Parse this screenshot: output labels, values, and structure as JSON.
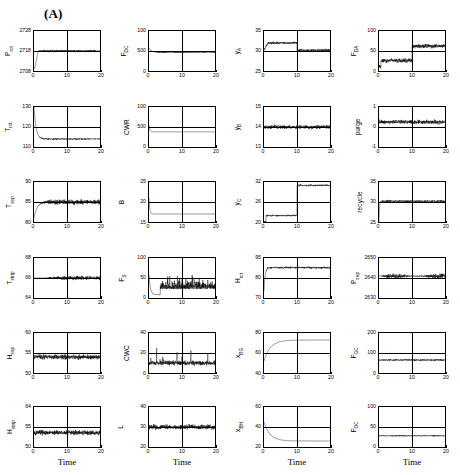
{
  "figure": {
    "panel_label": "(A)",
    "xlabel": "Time",
    "xticks": [
      "0",
      "10",
      "20"
    ],
    "xlim": [
      0,
      20
    ]
  },
  "chart_data": [
    {
      "type": "line",
      "index": 0,
      "row": 1,
      "col": 1,
      "ylabel": "P",
      "ylabel_sub": "rct",
      "yticks": [
        "2728",
        "2718",
        "2708"
      ],
      "ylim": [
        2708,
        2728
      ],
      "title": "",
      "xlabel": "",
      "grid": true,
      "x": [
        0,
        20
      ],
      "description": "starts low, rises to ~2718 then oscillates with growing noise band",
      "series": [
        {
          "name": "P_rct",
          "start": 2709,
          "settle": 2718,
          "noise": 0.45,
          "trend": "step-up-then-noisy"
        }
      ]
    },
    {
      "type": "line",
      "index": 1,
      "row": 1,
      "col": 2,
      "ylabel": "F",
      "ylabel_sub": "DC",
      "yticks": [
        "100",
        "500",
        "0"
      ],
      "ylim": [
        0,
        100
      ],
      "title": "",
      "xlabel": "",
      "grid": true,
      "x": [
        0,
        20
      ],
      "description": "spike at start then decays to ~47 with noise",
      "series": [
        {
          "name": "F_DC",
          "start": 58,
          "settle": 47,
          "noise": 0.25,
          "trend": "decay-noisy"
        }
      ]
    },
    {
      "type": "line",
      "index": 2,
      "row": 1,
      "col": 3,
      "ylabel": "y",
      "ylabel_sub": "A",
      "yticks": [
        "35",
        "30",
        "25"
      ],
      "ylim": [
        25,
        35
      ],
      "title": "",
      "xlabel": "",
      "grid": true,
      "x": [
        0,
        20
      ],
      "description": "plateau ~32 until t=10 then steps down to ~30",
      "series": [
        {
          "name": "y_A",
          "start": 30,
          "settle": 30,
          "noise": 0.5,
          "trend": "plateau-then-step-down-at-10"
        }
      ]
    },
    {
      "type": "line",
      "index": 3,
      "row": 1,
      "col": 4,
      "ylabel": "F",
      "ylabel_sub": "DA",
      "yticks": [
        "100",
        "50",
        "0"
      ],
      "ylim": [
        0,
        100
      ],
      "title": "",
      "xlabel": "",
      "grid": true,
      "x": [
        0,
        20
      ],
      "description": "noisy low ~25 until t=10 then jumps to ~62",
      "series": [
        {
          "name": "F_DA",
          "start": 10,
          "settle": 62,
          "noise": 0.9,
          "trend": "step-up-at-10"
        }
      ]
    },
    {
      "type": "line",
      "index": 4,
      "row": 2,
      "col": 1,
      "ylabel": "T",
      "ylabel_sub": "rct",
      "yticks": [
        "130",
        "120",
        "110"
      ],
      "ylim": [
        110,
        130
      ],
      "title": "",
      "xlabel": "",
      "grid": true,
      "x": [
        0,
        20
      ],
      "description": "decays from 130 to ~114 then noisy band",
      "series": [
        {
          "name": "T_rct",
          "start": 130,
          "settle": 114,
          "noise": 0.3,
          "trend": "decay-noisy"
        }
      ]
    },
    {
      "type": "line",
      "index": 5,
      "row": 2,
      "col": 2,
      "ylabel": "CWR",
      "ylabel_sub": "",
      "yticks": [
        "100",
        "500",
        "0"
      ],
      "ylim": [
        0,
        100
      ],
      "title": "",
      "xlabel": "",
      "grid": true,
      "x": [
        0,
        20
      ],
      "description": "spike at t=0 then flat ~38 line",
      "series": [
        {
          "name": "CWR",
          "start": 56,
          "settle": 38,
          "noise": 0.05,
          "trend": "decay-flat"
        }
      ]
    },
    {
      "type": "line",
      "index": 6,
      "row": 2,
      "col": 3,
      "ylabel": "y",
      "ylabel_sub": "B",
      "yticks": [
        "15",
        "14",
        "13"
      ],
      "ylim": [
        13,
        15
      ],
      "title": "",
      "xlabel": "",
      "grid": true,
      "x": [
        0,
        20
      ],
      "description": "noisy around 14 with dip at start",
      "series": [
        {
          "name": "y_B",
          "start": 13.5,
          "settle": 14.0,
          "noise": 0.8,
          "trend": "noisy-flat"
        }
      ]
    },
    {
      "type": "line",
      "index": 7,
      "row": 2,
      "col": 4,
      "ylabel": "purge",
      "ylabel_sub": "",
      "yticks": [
        "1",
        "0",
        "-1"
      ],
      "ylim": [
        -1,
        1
      ],
      "title": "",
      "xlabel": "",
      "grid": true,
      "x": [
        0,
        20
      ],
      "description": "noisy around 0.25, entirely above midline",
      "series": [
        {
          "name": "purge",
          "start": 0.2,
          "settle": 0.25,
          "noise": 0.9,
          "trend": "noisy-flat"
        }
      ]
    },
    {
      "type": "line",
      "index": 8,
      "row": 3,
      "col": 1,
      "ylabel": "T",
      "ylabel_sub": "sep",
      "yticks": [
        "90",
        "85",
        "80"
      ],
      "ylim": [
        80,
        90
      ],
      "title": "",
      "xlabel": "",
      "grid": true,
      "x": [
        0,
        20
      ],
      "description": "rises from 81 to 85 then large amplitude oscillation",
      "series": [
        {
          "name": "T_sep",
          "start": 81,
          "settle": 85,
          "noise": 1.0,
          "trend": "rise-then-oscillate"
        }
      ]
    },
    {
      "type": "line",
      "index": 9,
      "row": 3,
      "col": 2,
      "ylabel": "B",
      "ylabel_sub": "",
      "yticks": [
        "25",
        "20",
        "15"
      ],
      "ylim": [
        15,
        25
      ],
      "title": "",
      "xlabel": "",
      "grid": true,
      "x": [
        0,
        20
      ],
      "description": "decays from 21 to flat ~17",
      "series": [
        {
          "name": "B",
          "start": 21,
          "settle": 17,
          "noise": 0.05,
          "trend": "decay-flat"
        }
      ]
    },
    {
      "type": "line",
      "index": 10,
      "row": 3,
      "col": 3,
      "ylabel": "y",
      "ylabel_sub": "C",
      "yticks": [
        "32",
        "26",
        "20"
      ],
      "ylim": [
        20,
        32
      ],
      "title": "",
      "xlabel": "",
      "grid": true,
      "x": [
        0,
        20
      ],
      "description": "rises from 20 to ~27 then steps up at t=10 to ~31",
      "series": [
        {
          "name": "y_C",
          "start": 20,
          "settle": 31,
          "noise": 0.35,
          "trend": "rise-step-up-at-10"
        }
      ]
    },
    {
      "type": "line",
      "index": 11,
      "row": 3,
      "col": 4,
      "ylabel": "recycle",
      "ylabel_sub": "",
      "yticks": [
        "35",
        "30",
        "25"
      ],
      "ylim": [
        25,
        35
      ],
      "title": "",
      "xlabel": "",
      "grid": true,
      "x": [
        0,
        20
      ],
      "description": "jumps to ~30.5 then noisy band around 30",
      "series": [
        {
          "name": "recycle",
          "start": 25,
          "settle": 30.2,
          "noise": 0.45,
          "trend": "jump-then-noisy"
        }
      ]
    },
    {
      "type": "line",
      "index": 12,
      "row": 4,
      "col": 1,
      "ylabel": "T",
      "ylabel_sub": "strip",
      "yticks": [
        "68",
        "66",
        "64"
      ],
      "ylim": [
        64,
        68
      ],
      "title": "",
      "xlabel": "",
      "grid": true,
      "x": [
        0,
        20
      ],
      "description": "flat at 66 then growing oscillation after t=4",
      "series": [
        {
          "name": "T_strip",
          "start": 66,
          "settle": 66,
          "noise": 0.8,
          "trend": "flat-then-oscillate"
        }
      ]
    },
    {
      "type": "line",
      "index": 13,
      "row": 4,
      "col": 2,
      "ylabel": "F",
      "ylabel_sub": "S",
      "yticks": [
        "100",
        "50",
        "0"
      ],
      "ylim": [
        0,
        100
      ],
      "title": "",
      "xlabel": "",
      "grid": true,
      "x": [
        0,
        20
      ],
      "description": "spike then low flat, then large spiky excursions up to ~65",
      "series": [
        {
          "name": "F_S",
          "start": 50,
          "settle": 30,
          "noise": 1.0,
          "trend": "spike-decay-then-spiky"
        }
      ]
    },
    {
      "type": "line",
      "index": 14,
      "row": 4,
      "col": 3,
      "ylabel": "H",
      "ylabel_sub": "rct",
      "yticks": [
        "95",
        "80",
        "70"
      ],
      "ylim": [
        70,
        95
      ],
      "title": "",
      "xlabel": "",
      "grid": true,
      "x": [
        0,
        20
      ],
      "description": "rises quickly to ~89 then noisy band",
      "series": [
        {
          "name": "H_rct",
          "start": 74,
          "settle": 89,
          "noise": 0.4,
          "trend": "rise-then-noisy"
        }
      ]
    },
    {
      "type": "line",
      "index": 15,
      "row": 4,
      "col": 4,
      "ylabel": "P",
      "ylabel_sub": "sep",
      "yticks": [
        "2650",
        "2640",
        "2630"
      ],
      "ylim": [
        2630,
        2650
      ],
      "title": "",
      "xlabel": "",
      "grid": true,
      "x": [
        0,
        20
      ],
      "description": "large amplitude oscillation around 2640",
      "series": [
        {
          "name": "P_sep",
          "start": 2638,
          "settle": 2641,
          "noise": 1.0,
          "trend": "large-oscillation"
        }
      ]
    },
    {
      "type": "line",
      "index": 16,
      "row": 5,
      "col": 1,
      "ylabel": "H",
      "ylabel_sub": "sep",
      "yticks": [
        "60",
        "55",
        "50"
      ],
      "ylim": [
        50,
        60
      ],
      "title": "",
      "xlabel": "",
      "grid": true,
      "x": [
        0,
        20
      ],
      "description": "dense noise band around 54",
      "series": [
        {
          "name": "H_sep",
          "start": 54,
          "settle": 54,
          "noise": 1.0,
          "trend": "noisy-flat"
        }
      ]
    },
    {
      "type": "line",
      "index": 17,
      "row": 5,
      "col": 2,
      "ylabel": "CWC",
      "ylabel_sub": "",
      "yticks": [
        "40",
        "20",
        "0"
      ],
      "ylim": [
        0,
        40
      ],
      "title": "",
      "xlabel": "",
      "grid": true,
      "x": [
        0,
        20
      ],
      "description": "noisy around 10 with occasional spike to 25",
      "series": [
        {
          "name": "CWC",
          "start": 10,
          "settle": 10,
          "noise": 1.0,
          "trend": "noisy-flat-spikes"
        }
      ]
    },
    {
      "type": "line",
      "index": 18,
      "row": 5,
      "col": 3,
      "ylabel": "x",
      "ylabel_sub": "BG",
      "yticks": [
        "80",
        "60",
        "40"
      ],
      "ylim": [
        40,
        80
      ],
      "title": "",
      "xlabel": "",
      "grid": true,
      "x": [
        0,
        20
      ],
      "description": "smooth rise from 52 saturating at ~73",
      "series": [
        {
          "name": "x_BG",
          "start": 52,
          "settle": 73,
          "noise": 0.05,
          "trend": "smooth-rise-saturate"
        }
      ]
    },
    {
      "type": "line",
      "index": 19,
      "row": 5,
      "col": 4,
      "ylabel": "F",
      "ylabel_sub": "GC",
      "yticks": [
        "200",
        "100",
        "0"
      ],
      "ylim": [
        0,
        200
      ],
      "title": "",
      "xlabel": "",
      "grid": true,
      "x": [
        0,
        20
      ],
      "description": "flat noisy band around 65",
      "series": [
        {
          "name": "F_GC",
          "start": 65,
          "settle": 65,
          "noise": 0.35,
          "trend": "noisy-flat"
        }
      ]
    },
    {
      "type": "line",
      "index": 20,
      "row": 6,
      "col": 1,
      "ylabel": "H",
      "ylabel_sub": "strip",
      "yticks": [
        "64",
        "55",
        "50"
      ],
      "ylim": [
        50,
        64
      ],
      "title": "",
      "xlabel": "Time",
      "grid": true,
      "x": [
        0,
        20
      ],
      "description": "dense noise band around 55",
      "series": [
        {
          "name": "H_strip",
          "start": 55,
          "settle": 55,
          "noise": 1.0,
          "trend": "noisy-flat"
        }
      ]
    },
    {
      "type": "line",
      "index": 21,
      "row": 6,
      "col": 2,
      "ylabel": "L",
      "ylabel_sub": "",
      "yticks": [
        "40",
        "30",
        "20"
      ],
      "ylim": [
        20,
        40
      ],
      "title": "",
      "xlabel": "Time",
      "grid": true,
      "x": [
        0,
        20
      ],
      "description": "noisy band around 30",
      "series": [
        {
          "name": "L",
          "start": 30,
          "settle": 30,
          "noise": 1.0,
          "trend": "noisy-flat"
        }
      ]
    },
    {
      "type": "line",
      "index": 22,
      "row": 6,
      "col": 3,
      "ylabel": "x",
      "ylabel_sub": "BH",
      "yticks": [
        "60",
        "40",
        "20"
      ],
      "ylim": [
        20,
        60
      ],
      "title": "",
      "xlabel": "Time",
      "grid": true,
      "x": [
        0,
        20
      ],
      "description": "smooth decay from 45 settling at ~26",
      "series": [
        {
          "name": "x_BH",
          "start": 45,
          "settle": 26,
          "noise": 0.05,
          "trend": "smooth-decay-settle"
        }
      ]
    },
    {
      "type": "line",
      "index": 23,
      "row": 6,
      "col": 4,
      "ylabel": "F",
      "ylabel_sub": "OC",
      "yticks": [
        "100",
        "50",
        "0"
      ],
      "ylim": [
        0,
        100
      ],
      "title": "",
      "xlabel": "Time",
      "grid": true,
      "x": [
        0,
        20
      ],
      "description": "flat noisy band around 28",
      "series": [
        {
          "name": "F_OC",
          "start": 28,
          "settle": 28,
          "noise": 0.25,
          "trend": "noisy-flat"
        }
      ]
    }
  ]
}
